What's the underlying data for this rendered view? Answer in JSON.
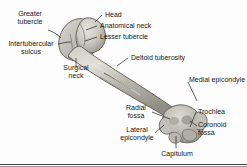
{
  "figure": {
    "background_color": "#fdfdfd",
    "bone_fill_light": "#d8d6cf",
    "bone_fill_mid": "#b3b1a9",
    "bone_fill_dark": "#8c8a83",
    "outline_color": "#5a584f",
    "label_color": "#151515",
    "leader_color": "#2b2b2b"
  },
  "labels": {
    "greater_tubercle": "Greater\ntubercle",
    "head": "Head",
    "anatomical_neck": "Anatomical neck",
    "lesser_tubercle": "Lesser tubercle",
    "intertubercular_sulcus": "Intertubercular\nsulcus",
    "surgical_neck": "Surgical\nneck",
    "deltoid_tuberosity": "Deltoid tuberosity",
    "medial_epicondyle": "Medial epicondyle",
    "radial_fossa": "Radial\nfossa",
    "trochlea": "Trochlea",
    "coronoid_fossa": "Coronoid\nfossa",
    "lateral_epicondyle": "Lateral\nepicondyle",
    "capitulum": "Capitulum"
  }
}
